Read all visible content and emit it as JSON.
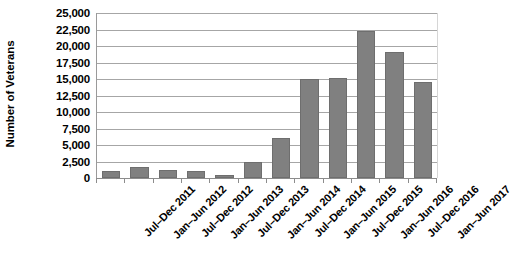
{
  "chart_data": {
    "type": "bar",
    "title": "",
    "xlabel": "",
    "ylabel": "Number of Veterans",
    "ylim": [
      0,
      25000
    ],
    "ytick_values": [
      0,
      2500,
      5000,
      7500,
      10000,
      12500,
      15000,
      17500,
      20000,
      22500,
      25000
    ],
    "ytick_labels": [
      "0",
      "2,500",
      "5,000",
      "7,500",
      "10,000",
      "12,500",
      "15,000",
      "17,500",
      "20,000",
      "22,500",
      "25,000"
    ],
    "grid": true,
    "legend": false,
    "bar_color": "#808080",
    "categories": [
      "Jul–Dec 2011",
      "Jan–Jun 2012",
      "Jul–Dec 2012",
      "Jan–Jun 2013",
      "Jul–Dec 2013",
      "Jan–Jun 2014",
      "Jul–Dec 2014",
      "Jan–Jun 2015",
      "Jul–Dec 2015",
      "Jan–Jun 2016",
      "Jul–Dec 2016",
      "Jan–Jun 2017"
    ],
    "values": [
      1100,
      1600,
      1250,
      1050,
      500,
      2400,
      6050,
      15000,
      15200,
      22300,
      19100,
      14600
    ]
  }
}
